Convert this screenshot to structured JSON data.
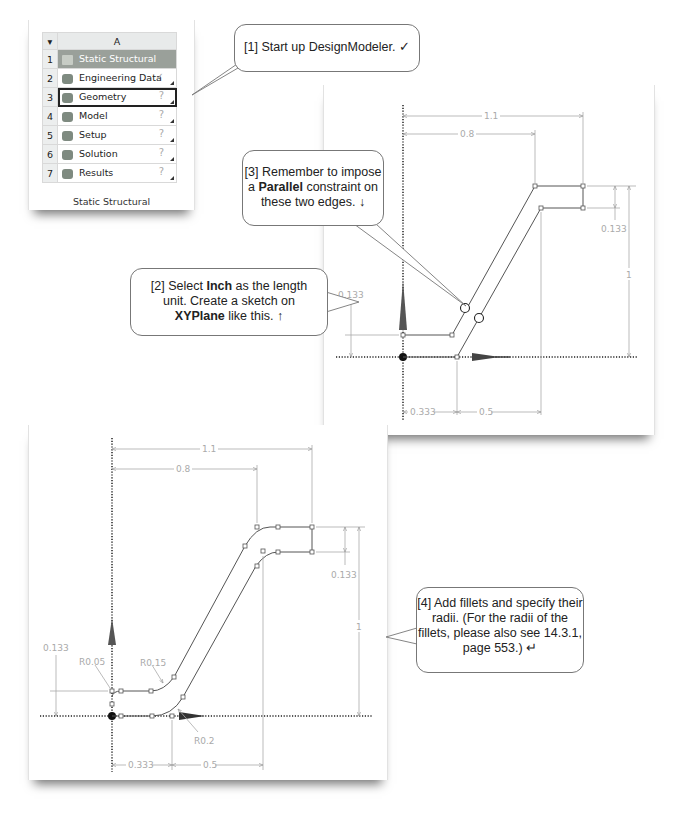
{
  "workbench": {
    "column_header": "A",
    "rows": [
      {
        "num": "1",
        "label": "Static Structural",
        "status": "",
        "icon": "static-structural-icon"
      },
      {
        "num": "2",
        "label": "Engineering Data",
        "status": "✓",
        "icon": "engineering-data-icon"
      },
      {
        "num": "3",
        "label": "Geometry",
        "status": "?",
        "icon": "geometry-icon"
      },
      {
        "num": "4",
        "label": "Model",
        "status": "?",
        "icon": "model-icon"
      },
      {
        "num": "5",
        "label": "Setup",
        "status": "?",
        "icon": "setup-icon"
      },
      {
        "num": "6",
        "label": "Solution",
        "status": "?",
        "icon": "solution-icon"
      },
      {
        "num": "7",
        "label": "Results",
        "status": "?",
        "icon": "results-icon"
      }
    ],
    "caption": "Static Structural"
  },
  "callouts": {
    "step1": {
      "text": "[1] Start up DesignModeler.",
      "mark": "✓"
    },
    "step2": {
      "line1_pre": "[2] Select ",
      "line1_bold": "Inch",
      "line1_post": " as the length",
      "line2": "unit.  Create a sketch on",
      "line3_bold": "XYPlane",
      "line3_post": " like this.",
      "mark": "↑"
    },
    "step3": {
      "line1": "[3] Remember to impose",
      "line2_pre": "a ",
      "line2_bold": "Parallel",
      "line2_post": " constraint on",
      "line3": "these two edges.",
      "mark": "↓"
    },
    "step4": {
      "line1": "[4] Add fillets and specify their",
      "line2": "radii.  (For the radii of the",
      "line3": "fillets, please also see 14.3.1,",
      "line4": "page 553.)",
      "mark": "↵"
    }
  },
  "sketch_top": {
    "dims": {
      "d_1_1": "1.1",
      "d_0_8": "0.8",
      "d_0_133_right": "0.133",
      "d_1": "1",
      "d_0_133_left": "0.133",
      "d_0_333": "0.333",
      "d_0_5": "0.5"
    }
  },
  "sketch_bottom": {
    "dims": {
      "d_1_1": "1.1",
      "d_0_8": "0.8",
      "d_0_133_right": "0.133",
      "d_1": "1",
      "d_0_133_left": "0.133",
      "d_0_333": "0.333",
      "d_0_5": "0.5"
    },
    "radii": {
      "r1": "R0.05",
      "r2": "R0.15",
      "r3": "R0.2"
    }
  }
}
